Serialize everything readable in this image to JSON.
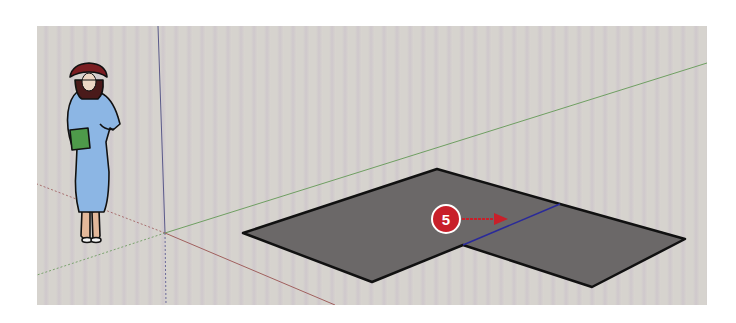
{
  "app": {
    "view": "SketchUp 3D modeling viewport",
    "background_color": "#d4d0cb"
  },
  "axes": {
    "red": {
      "color": "#a87070",
      "label": "red-axis"
    },
    "green": {
      "color": "#7aa36e",
      "label": "green-axis"
    },
    "blue": {
      "color": "#6a6a9a",
      "label": "blue-axis"
    }
  },
  "scale_figure": {
    "description": "Woman scale figure in blue dress with red hat holding green book",
    "dress_color": "#8cb6e4",
    "hat_color": "#7a1e22",
    "book_color": "#4e9a4a"
  },
  "shape": {
    "description": "L-shaped gray face with blue inference line",
    "fill": "#6b6868",
    "edge_color": "#111111",
    "divider_color": "#2a2a9a"
  },
  "callout": {
    "step_number": "5",
    "color": "#c8202a",
    "arrow_direction": "right"
  }
}
